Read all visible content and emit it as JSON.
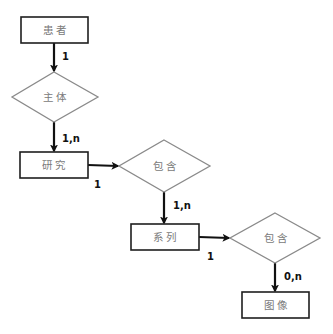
{
  "diagram": {
    "type": "er-diagram",
    "entities": {
      "patient": {
        "label": "患者"
      },
      "study": {
        "label": "研究"
      },
      "series": {
        "label": "系列"
      },
      "image": {
        "label": "图像"
      }
    },
    "relationships": {
      "subject": {
        "label": "主体"
      },
      "contains_1": {
        "label": "包含"
      },
      "contains_2": {
        "label": "包含"
      }
    },
    "cardinalities": {
      "patient_subject": "1",
      "subject_study": "1,n",
      "study_contains": "1",
      "contains_series": "1,n",
      "series_contains": "1",
      "contains_image": "0,n"
    },
    "colors": {
      "entity_border": "#1e1e1e",
      "diamond_border": "#8a8a8a",
      "node_text": "#7a7a7a",
      "arrow": "#111111"
    }
  }
}
